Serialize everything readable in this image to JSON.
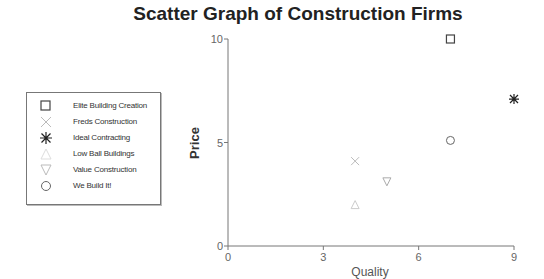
{
  "chart_data": {
    "type": "scatter",
    "title": "Scatter Graph of Construction Firms",
    "xlabel": "Quality",
    "ylabel": "Price",
    "xlim": [
      0,
      9
    ],
    "ylim": [
      0,
      10
    ],
    "x_ticks": [
      0,
      3,
      6,
      9
    ],
    "y_ticks": [
      0,
      5,
      10
    ],
    "x_tick_labels": [
      "0",
      "3",
      "6",
      "9"
    ],
    "y_tick_labels": [
      "0",
      "5",
      "10"
    ],
    "grid": false,
    "legend_position": "left",
    "series": [
      {
        "name": "Elite Building Creation",
        "marker": "square",
        "color": "#444444",
        "points": [
          {
            "x": 7,
            "y": 10
          }
        ]
      },
      {
        "name": "Freds Construction",
        "marker": "x",
        "color": "#bbbbbb",
        "points": [
          {
            "x": 4,
            "y": 4.1
          }
        ]
      },
      {
        "name": "Ideal Contracting",
        "marker": "asterisk",
        "color": "#222222",
        "points": [
          {
            "x": 9,
            "y": 7.1
          }
        ]
      },
      {
        "name": "Low Ball Buildings",
        "marker": "triangle-up",
        "color": "#cccccc",
        "points": [
          {
            "x": 4,
            "y": 2
          }
        ]
      },
      {
        "name": "Value Construction",
        "marker": "triangle-down",
        "color": "#aaaaaa",
        "points": [
          {
            "x": 5,
            "y": 3.1
          }
        ]
      },
      {
        "name": "We Build It!",
        "marker": "circle",
        "color": "#666666",
        "points": [
          {
            "x": 7,
            "y": 5.1
          }
        ]
      }
    ]
  },
  "legend_labels": [
    "Elite Building Creation",
    "Freds Construction",
    "Ideal Contracting",
    "Low Ball Buildings",
    "Value Construction",
    "We Build It!"
  ]
}
